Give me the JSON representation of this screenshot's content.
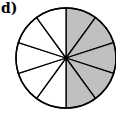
{
  "label": "d)",
  "diagram": {
    "type": "fraction-circle",
    "total_slices": 10,
    "shaded_slices": 5,
    "shaded_range": "top clockwise to bottom (right half)",
    "shade_color": "#c0c0c0",
    "line_color": "#000000",
    "center": [
      66,
      58
    ],
    "radius": 50
  }
}
